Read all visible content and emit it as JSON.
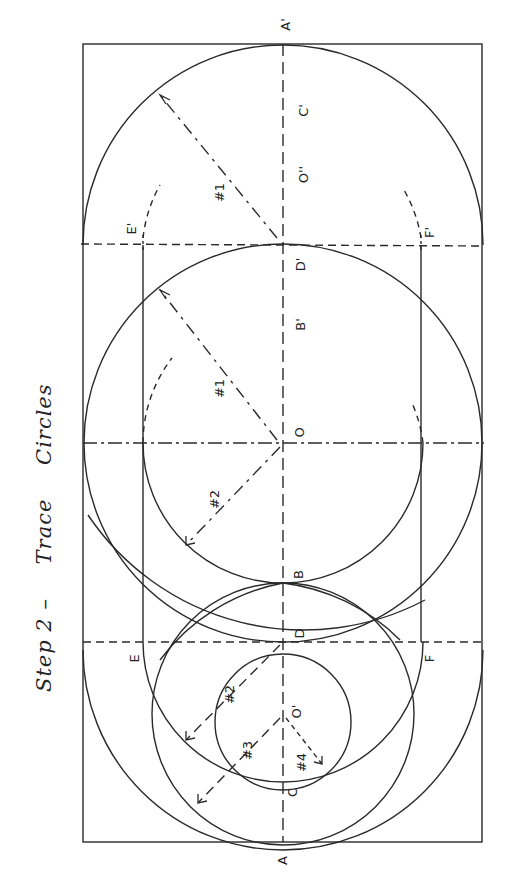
{
  "title": {
    "step": "Step 2 –",
    "word1": "Trace",
    "word2": "Circles"
  },
  "labels": {
    "A": "A",
    "A_prime": "A'",
    "B": "B",
    "B_prime": "B'",
    "C": "C",
    "C_prime": "C'",
    "D": "D",
    "D_prime": "D'",
    "E": "E",
    "E_prime": "E'",
    "F": "F",
    "F_prime": "F'",
    "O": "O",
    "O_prime": "O'",
    "O_double_prime": "O''",
    "radius_1_top": "#1",
    "radius_1_mid": "#1",
    "radius_2_mid": "#2",
    "radius_2_low": "#2",
    "radius_3": "#3",
    "radius_4": "#4"
  },
  "colors": {
    "ink": "#2a2a2a",
    "paper": "#ffffff"
  }
}
